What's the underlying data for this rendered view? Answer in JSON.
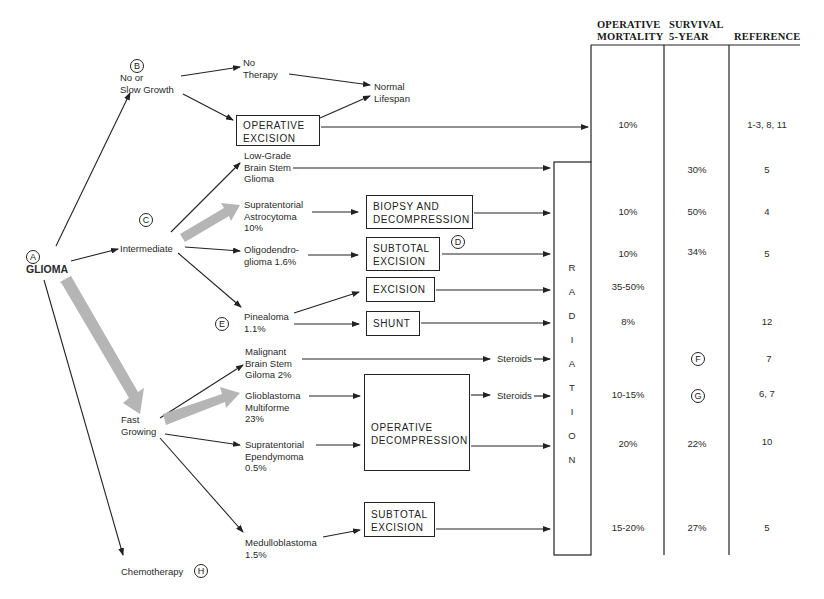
{
  "diagram": {
    "root": {
      "marker": "A",
      "label": "GLIOMA"
    },
    "growth_categories": [
      {
        "marker": "B",
        "label": "No or\nSlow Growth"
      },
      {
        "marker": "C",
        "label": "Intermediate"
      },
      {
        "marker": "",
        "label": "Fast\nGrowing"
      },
      {
        "marker": "H",
        "label": "Chemotherapy"
      }
    ],
    "outcomes": {
      "no_therapy": "No\nTherapy",
      "normal_lifespan": "Normal\nLifespan"
    },
    "tumors": [
      {
        "id": "low_grade",
        "label": "Low-Grade\nBrain Stem\nGlioma"
      },
      {
        "id": "astro",
        "label": "Supratentorial\nAstrocytoma\n10%"
      },
      {
        "id": "oligo",
        "label": "Oligodendro-\nglioma 1.6%"
      },
      {
        "id": "pinealoma",
        "label": "Pinealoma\n1.1%",
        "marker": "E"
      },
      {
        "id": "malignant_bs",
        "label": "Malignant\nBrain Stem\nGiloma 2%"
      },
      {
        "id": "gbm",
        "label": "Glioblastoma\nMultiforme\n23%"
      },
      {
        "id": "ependymoma",
        "label": "Supratentorial\nEpendymoma\n0.5%"
      },
      {
        "id": "medullo",
        "label": "Medulloblastoma\n1.5%"
      }
    ],
    "treatments": {
      "operative_excision": "OPERATIVE\nEXCISION",
      "biopsy": "BIOPSY AND\nDECOMPRESSION",
      "subtotal_1": "SUBTOTAL\nEXCISION",
      "subtotal_1_marker": "D",
      "excision": "EXCISION",
      "shunt": "SHUNT",
      "operative_decompression": "OPERATIVE\nDECOMPRESSION",
      "subtotal_2": "SUBTOTAL\nEXCISION",
      "steroids_1": "Steroids",
      "steroids_2": "Steroids"
    },
    "radiation": [
      "R",
      "A",
      "D",
      "I",
      "A",
      "T",
      "I",
      "O",
      "N"
    ]
  },
  "table": {
    "headers": {
      "mortality": "OPERATIVE\nMORTALITY",
      "survival": "SURVIVAL\n5-YEAR",
      "reference": "REFERENCE"
    },
    "rows": [
      {
        "mortality": "10%",
        "survival": "",
        "reference": "1-3, 8, 11"
      },
      {
        "mortality": "",
        "survival": "30%",
        "reference": "5"
      },
      {
        "mortality": "10%",
        "survival": "50%",
        "reference": "4"
      },
      {
        "mortality": "10%",
        "survival": "34%",
        "reference": "5"
      },
      {
        "mortality": "35-50%",
        "survival": "",
        "reference": ""
      },
      {
        "mortality": "8%",
        "survival": "",
        "reference": "12"
      },
      {
        "mortality": "",
        "survival_marker": "F",
        "reference": "7"
      },
      {
        "mortality": "10-15%",
        "survival_marker": "G",
        "reference": "6, 7"
      },
      {
        "mortality": "20%",
        "survival": "22%",
        "reference": "10"
      },
      {
        "mortality": "15-20%",
        "survival": "27%",
        "reference": "5"
      }
    ]
  },
  "colors": {
    "line": "#222222",
    "thick_arrow": "#b5b5b5"
  }
}
